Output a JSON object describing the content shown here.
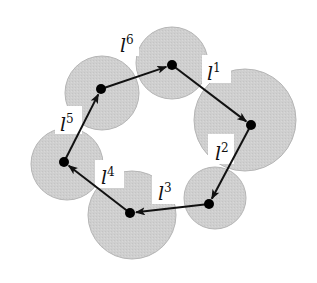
{
  "diagram": {
    "colors": {
      "disk_fill": "#cfcfcf",
      "disk_stroke": "#b5b5b5",
      "node": "#000000",
      "edge": "#111111",
      "label_bg": "#ffffff"
    },
    "disks": [
      {
        "id": "A",
        "cx": 102,
        "cy": 93,
        "r": 37
      },
      {
        "id": "B",
        "cx": 172,
        "cy": 63,
        "r": 36
      },
      {
        "id": "C",
        "cx": 245,
        "cy": 120,
        "r": 51
      },
      {
        "id": "D",
        "cx": 215,
        "cy": 198,
        "r": 31
      },
      {
        "id": "E",
        "cx": 132,
        "cy": 215,
        "r": 44
      },
      {
        "id": "F",
        "cx": 67,
        "cy": 164,
        "r": 36
      }
    ],
    "nodes": [
      {
        "id": "A",
        "x": 101,
        "y": 89
      },
      {
        "id": "B",
        "x": 172,
        "y": 65
      },
      {
        "id": "C",
        "x": 251,
        "y": 125
      },
      {
        "id": "D",
        "x": 209,
        "y": 204
      },
      {
        "id": "E",
        "x": 130,
        "y": 213
      },
      {
        "id": "F",
        "x": 64,
        "y": 162
      }
    ],
    "edges": [
      {
        "from": "B",
        "to": "C",
        "label_base": "l",
        "label_sup": "1"
      },
      {
        "from": "C",
        "to": "D",
        "label_base": "l",
        "label_sup": "2"
      },
      {
        "from": "D",
        "to": "E",
        "label_base": "l",
        "label_sup": "3"
      },
      {
        "from": "E",
        "to": "F",
        "label_base": "l",
        "label_sup": "4"
      },
      {
        "from": "F",
        "to": "A",
        "label_base": "l",
        "label_sup": "5"
      },
      {
        "from": "A",
        "to": "B",
        "label_base": "l",
        "label_sup": "6"
      }
    ],
    "labels": [
      {
        "text": "l",
        "sup": "1",
        "x": 207,
        "y": 80,
        "bx": 202,
        "by": 55,
        "bw": 29,
        "bh": 28
      },
      {
        "text": "l",
        "sup": "2",
        "x": 215,
        "y": 160,
        "bx": 208,
        "by": 134,
        "bw": 26,
        "bh": 30
      },
      {
        "text": "l",
        "sup": "3",
        "x": 158,
        "y": 200,
        "bx": 152,
        "by": 174,
        "bw": 28,
        "bh": 30
      },
      {
        "text": "l",
        "sup": "4",
        "x": 101,
        "y": 184,
        "bx": 95,
        "by": 160,
        "bw": 29,
        "bh": 28
      },
      {
        "text": "l",
        "sup": "5",
        "x": 60,
        "y": 131,
        "bx": 55,
        "by": 106,
        "bw": 27,
        "bh": 28
      },
      {
        "text": "l",
        "sup": "6",
        "x": 120,
        "y": 52,
        "bx": 114,
        "by": 28,
        "bw": 25,
        "bh": 28
      }
    ]
  }
}
